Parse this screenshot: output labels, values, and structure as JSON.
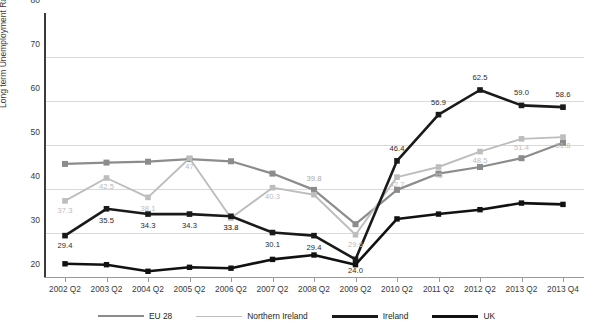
{
  "chart_data": {
    "type": "line",
    "title": "",
    "xlabel": "",
    "ylabel": "Long term Unemployment Rate",
    "ylim": [
      20,
      80
    ],
    "ytick_labels": [
      "80",
      "70",
      "60",
      "50",
      "40",
      "30",
      "20"
    ],
    "ytick_values": [
      80,
      70,
      60,
      50,
      40,
      30,
      20
    ],
    "grid": "horizontal",
    "legend_position": "bottom",
    "categories": [
      "2002 Q2",
      "2003 Q2",
      "2004 Q2",
      "2005 Q2",
      "2006 Q2",
      "2007 Q2",
      "2008 Q2",
      "2009 Q2",
      "2010 Q2",
      "2011 Q2",
      "2012 Q2",
      "2013 Q2",
      "2013 Q4"
    ],
    "series": [
      {
        "name": "EU 28",
        "color": "#8c8c8c",
        "marker": "square",
        "values": [
          45.7,
          46.0,
          46.2,
          46.8,
          46.3,
          43.5,
          39.8,
          32.0,
          39.8,
          43.5,
          45.0,
          47.0,
          50.5
        ],
        "labels": [
          "",
          "",
          "",
          "",
          "",
          "",
          "39.8",
          "",
          "",
          "",
          "",
          "",
          ""
        ]
      },
      {
        "name": "Northern Ireland",
        "color": "#bdbdbd",
        "marker": "square",
        "values": [
          37.3,
          42.5,
          38.1,
          47.0,
          33.4,
          40.3,
          38.7,
          29.6,
          42.7,
          45.0,
          48.5,
          51.4,
          51.8
        ],
        "labels": [
          "37.3",
          "42.5",
          "38.1",
          "47",
          "33.4",
          "40.3",
          "",
          "29.6",
          "42.7",
          "45",
          "48.5",
          "51.4",
          "51.8"
        ]
      },
      {
        "name": "Ireland",
        "color": "#1a1a1a",
        "marker": "square",
        "values": [
          29.4,
          35.5,
          34.3,
          34.3,
          33.8,
          30.1,
          29.4,
          24.0,
          46.4,
          56.9,
          62.5,
          59.0,
          58.6
        ],
        "labels": [
          "29.4",
          "35.5",
          "34.3",
          "34.3",
          "33.8",
          "30.1",
          "29.4",
          "24.0",
          "46.4",
          "56.9",
          "62.5",
          "59.0",
          "58.6"
        ]
      },
      {
        "name": "UK",
        "color": "#111111",
        "marker": "square",
        "values": [
          23.0,
          22.8,
          21.3,
          22.2,
          22.0,
          24.0,
          25.0,
          22.8,
          33.2,
          34.3,
          35.3,
          36.8,
          36.5
        ],
        "labels": [
          "",
          "",
          "",
          "",
          "",
          "",
          "",
          "",
          "",
          "",
          "",
          "",
          ""
        ]
      }
    ]
  },
  "legend": {
    "items": [
      {
        "label": "EU 28",
        "color": "#8c8c8c",
        "thickness": "2.2px"
      },
      {
        "label": "Northern Ireland",
        "color": "#bdbdbd",
        "thickness": "1.8px"
      },
      {
        "label": "Ireland",
        "color": "#1a1a1a",
        "thickness": "3px"
      },
      {
        "label": "UK",
        "color": "#111111",
        "thickness": "3.4px"
      }
    ]
  }
}
